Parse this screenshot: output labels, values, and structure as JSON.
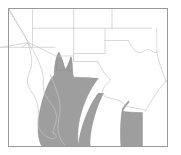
{
  "figure": {
    "type": "distribution-range-map",
    "title": "Range map of southwestern United States and northern Mexico",
    "caption": "Shaded area indicates species distribution",
    "width": 181,
    "height": 155
  },
  "style": {
    "background_color": "#ffffff",
    "frame_color": "#9a9a9a",
    "boundary_color": "#c9c9c9",
    "coastline_color": "#c4c4c4",
    "range_fill_color": "#9e9e9e",
    "range_stroke_color": "#8c8c8c",
    "frame_stroke_width": 1,
    "boundary_stroke_width": 0.7
  },
  "frame": {
    "x": 8.5,
    "y": 8.5,
    "width": 159,
    "height": 138
  },
  "legend": {
    "present": false,
    "shaded_label": "Range",
    "unshaded_label": "Absent"
  },
  "axes": {
    "labels_visible": false,
    "ticks_visible": false,
    "graticule": false
  },
  "regions": [
    {
      "id": "california",
      "name": "California",
      "type": "us-state",
      "shaded": false
    },
    {
      "id": "nevada",
      "name": "Nevada",
      "type": "us-state",
      "shaded": false
    },
    {
      "id": "utah",
      "name": "Utah",
      "type": "us-state",
      "shaded": false
    },
    {
      "id": "colorado",
      "name": "Colorado",
      "type": "us-state",
      "shaded": false
    },
    {
      "id": "kansas",
      "name": "Kansas",
      "type": "us-state",
      "shaded": false
    },
    {
      "id": "arizona",
      "name": "Arizona",
      "type": "us-state",
      "shaded": true
    },
    {
      "id": "new-mexico",
      "name": "New Mexico",
      "type": "us-state",
      "shaded": true
    },
    {
      "id": "oklahoma",
      "name": "Oklahoma",
      "type": "us-state",
      "shaded": false
    },
    {
      "id": "texas",
      "name": "Texas",
      "type": "us-state",
      "shaded": true
    },
    {
      "id": "baja-california",
      "name": "Baja California",
      "type": "mexico-state",
      "shaded": false
    },
    {
      "id": "sonora",
      "name": "Sonora",
      "type": "mexico-state",
      "shaded": true
    },
    {
      "id": "sinaloa",
      "name": "Sinaloa",
      "type": "mexico-state",
      "shaded": true
    },
    {
      "id": "gulf-of-california",
      "name": "Gulf of California",
      "type": "water",
      "shaded": false
    }
  ],
  "chart_data": {
    "type": "map",
    "title": "Range map of southwestern United States and northern Mexico",
    "xlabel": "",
    "ylabel": "",
    "shaded_regions": [
      "Sonoran and Sinaloan Pacific coastal plain",
      "Southeastern Arizona",
      "Southwestern New Mexico",
      "Lower Rio Grande Valley, South Texas"
    ],
    "unshaded_regions": [
      "California",
      "Nevada",
      "Utah",
      "Colorado",
      "Kansas",
      "Oklahoma",
      "Baja California peninsula",
      "Northern and eastern Texas"
    ]
  }
}
